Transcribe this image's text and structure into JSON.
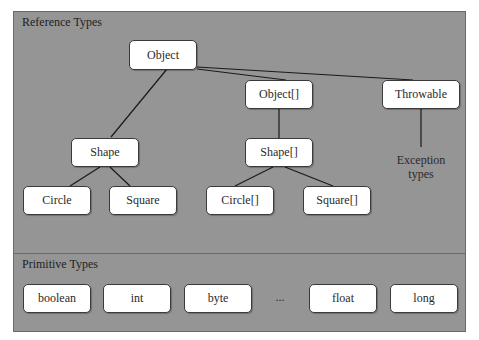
{
  "reference_types": {
    "title": "Reference Types",
    "nodes": {
      "object": "Object",
      "object_array": "Object[]",
      "throwable": "Throwable",
      "shape": "Shape",
      "shape_array": "Shape[]",
      "exception_types": "Exception types",
      "circle": "Circle",
      "square": "Square",
      "circle_array": "Circle[]",
      "square_array": "Square[]"
    },
    "edges": [
      [
        "object",
        "shape"
      ],
      [
        "object",
        "object_array"
      ],
      [
        "object",
        "throwable"
      ],
      [
        "object_array",
        "shape_array"
      ],
      [
        "throwable",
        "exception_types"
      ],
      [
        "shape",
        "circle"
      ],
      [
        "shape",
        "square"
      ],
      [
        "shape_array",
        "circle_array"
      ],
      [
        "shape_array",
        "square_array"
      ]
    ]
  },
  "primitive_types": {
    "title": "Primitive Types",
    "items": [
      "boolean",
      "int",
      "byte",
      "...",
      "float",
      "long"
    ]
  }
}
